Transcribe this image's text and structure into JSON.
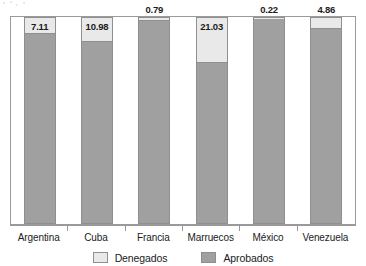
{
  "chart_data": {
    "type": "bar",
    "subtype": "stacked-percentage",
    "title": "",
    "subtitle": "",
    "xlabel": "",
    "ylabel": "",
    "ylim": [
      0,
      100
    ],
    "grid": false,
    "legend_position": "bottom-center",
    "categories": [
      "Argentina",
      "Cuba",
      "Francia",
      "Marruecos",
      "México",
      "Venezuela"
    ],
    "series": [
      {
        "name": "Denegados",
        "color": "#e9e9e9",
        "values": [
          7.11,
          10.98,
          0.79,
          21.03,
          0.22,
          4.86
        ]
      },
      {
        "name": "Aprobados",
        "color": "#a0a0a0",
        "values": [
          92.89,
          89.02,
          99.21,
          78.97,
          99.78,
          95.14
        ]
      }
    ],
    "data_labels": {
      "series": "Denegados",
      "values": [
        "7.11",
        "10.98",
        "0.79",
        "21.03",
        "0.22",
        "4.86"
      ],
      "placement": [
        "inside",
        "inside",
        "above",
        "inside",
        "above",
        "above"
      ]
    }
  },
  "bars": [
    {
      "category": "Argentina",
      "label": "7.11",
      "denegados": 7.11,
      "aprobados": 92.89,
      "label_placement": "inside"
    },
    {
      "category": "Cuba",
      "label": "10.98",
      "denegados": 10.98,
      "aprobados": 89.02,
      "label_placement": "inside"
    },
    {
      "category": "Francia",
      "label": "0.79",
      "denegados": 0.79,
      "aprobados": 99.21,
      "label_placement": "above"
    },
    {
      "category": "Marruecos",
      "label": "21.03",
      "denegados": 21.03,
      "aprobados": 78.97,
      "label_placement": "inside"
    },
    {
      "category": "México",
      "label": "0.22",
      "denegados": 0.22,
      "aprobados": 99.78,
      "label_placement": "above"
    },
    {
      "category": "Venezuela",
      "label": "4.86",
      "denegados": 4.86,
      "aprobados": 95.14,
      "label_placement": "above"
    }
  ],
  "legend": {
    "items": [
      {
        "label": "Denegados",
        "color": "#e9e9e9"
      },
      {
        "label": "Aprobados",
        "color": "#a0a0a0"
      }
    ]
  },
  "colors": {
    "denegados": "#e9e9e9",
    "aprobados": "#a0a0a0",
    "frame": "#9a9a9a",
    "text": "#1b1b1b",
    "background": "#ffffff"
  }
}
